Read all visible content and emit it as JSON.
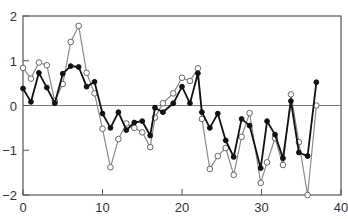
{
  "chart_data": {
    "type": "line",
    "title": "",
    "xlabel": "",
    "ylabel": "",
    "xlim": [
      0,
      40
    ],
    "ylim": [
      -2,
      2
    ],
    "xticks": [
      0,
      10,
      20,
      30,
      40
    ],
    "yticks": [
      -2,
      -1,
      0,
      1,
      2
    ],
    "xtick_labels": [
      "0",
      "10",
      "20",
      "30",
      "40"
    ],
    "ytick_labels": [
      "−2",
      "−1",
      "0",
      "1",
      "2"
    ],
    "zero_line": true,
    "grid": false,
    "legend": null,
    "series": [
      {
        "name": "open-circle series",
        "marker": "open-circle",
        "color": "#8a8a8a",
        "x": [
          0,
          1,
          2,
          3,
          4,
          5,
          6,
          7,
          8,
          9,
          10,
          11,
          12,
          13,
          14,
          15,
          16,
          16.6,
          17.6,
          18.9,
          20,
          21,
          22,
          22.5,
          23.5,
          24.5,
          25.5,
          26.5,
          27.5,
          28.5,
          29.9,
          30.7,
          31.7,
          32.7,
          33.7,
          34.7,
          35.8,
          36.9
        ],
        "y": [
          0.84,
          0.6,
          0.96,
          0.9,
          0.1,
          0.48,
          1.42,
          1.78,
          0.73,
          0.27,
          -0.52,
          -1.38,
          -0.75,
          -0.4,
          -0.5,
          -0.6,
          -0.93,
          -0.27,
          0.05,
          0.27,
          0.62,
          0.55,
          0.83,
          -0.3,
          -1.42,
          -1.13,
          -0.95,
          -1.55,
          -0.7,
          -0.17,
          -1.73,
          -1.27,
          -0.73,
          -1.33,
          0.25,
          -0.82,
          -2.0,
          0.0
        ]
      },
      {
        "name": "filled-circle series",
        "marker": "filled-circle",
        "color": "#111111",
        "x": [
          0,
          1,
          2,
          3,
          4,
          5,
          6,
          7,
          8,
          9,
          10,
          11,
          12,
          13,
          14,
          15,
          16,
          16.6,
          17.6,
          18.9,
          20,
          21,
          22,
          22.5,
          23.5,
          24.5,
          25.5,
          26.5,
          27.5,
          28.5,
          29.9,
          30.7,
          31.7,
          32.7,
          33.7,
          34.7,
          35.8,
          36.9
        ],
        "y": [
          0.38,
          0.08,
          0.73,
          0.4,
          0.05,
          0.71,
          0.88,
          0.86,
          0.42,
          0.53,
          -0.18,
          -0.5,
          -0.15,
          -0.55,
          -0.38,
          -0.35,
          -0.67,
          -0.05,
          -0.15,
          0.05,
          0.42,
          0.05,
          0.72,
          -0.15,
          -0.5,
          -0.18,
          -0.78,
          -1.15,
          -0.3,
          -0.45,
          -1.4,
          -0.35,
          -0.65,
          -1.18,
          0.1,
          -1.05,
          -1.13,
          0.52
        ]
      }
    ]
  },
  "plot_area": {
    "left": 23,
    "top": 16,
    "right": 341,
    "bottom": 195
  }
}
